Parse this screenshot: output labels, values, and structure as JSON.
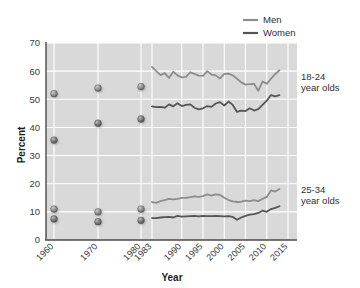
{
  "chart_data": {
    "type": "line",
    "title": "",
    "xlabel": "Year",
    "ylabel": "Percent",
    "ylim": [
      0,
      70
    ],
    "ytick_values": [
      0,
      10,
      20,
      30,
      40,
      50,
      60,
      70
    ],
    "ytick_labels": [
      "0",
      "10",
      "20",
      "30",
      "40",
      "50",
      "60",
      "70"
    ],
    "xtick_values": [
      1960,
      1970,
      1980,
      1983,
      1990,
      1995,
      2000,
      2005,
      2010,
      2015
    ],
    "xtick_labels": [
      "1960",
      "1970",
      "1980",
      "1983",
      "1990",
      "1995",
      "2000",
      "2005",
      "2010",
      "2015"
    ],
    "xlim": [
      1957,
      2016
    ],
    "grid": true,
    "grid_color": "#ffffff",
    "plot_background": "#d9d9d9",
    "legend": {
      "position": "top-right",
      "entries": [
        {
          "name": "Men",
          "color": "#8d8d8d"
        },
        {
          "name": "Women",
          "color": "#555555"
        }
      ]
    },
    "annotations": [
      {
        "text_line1": "18-24",
        "text_line2": "year olds",
        "x": 2016,
        "y": 56
      },
      {
        "text_line1": "25-34",
        "text_line2": "year olds",
        "x": 2016,
        "y": 16
      }
    ],
    "scatter_series": [
      {
        "name": "Men 18-24",
        "group": "18-24",
        "sex": "Men",
        "color": "#8d8d8d",
        "marker": "sphere",
        "points": [
          {
            "x": 1960,
            "y": 52.0
          },
          {
            "x": 1970,
            "y": 54.0
          },
          {
            "x": 1980,
            "y": 54.5
          }
        ]
      },
      {
        "name": "Women 18-24",
        "group": "18-24",
        "sex": "Women",
        "color": "#6b6b6b",
        "marker": "sphere",
        "points": [
          {
            "x": 1960,
            "y": 35.5
          },
          {
            "x": 1970,
            "y": 41.5
          },
          {
            "x": 1980,
            "y": 43.0
          }
        ]
      },
      {
        "name": "Men 25-34",
        "group": "25-34",
        "sex": "Men",
        "color": "#8d8d8d",
        "marker": "sphere",
        "points": [
          {
            "x": 1960,
            "y": 11.0
          },
          {
            "x": 1970,
            "y": 10.0
          },
          {
            "x": 1980,
            "y": 11.0
          }
        ]
      },
      {
        "name": "Women 25-34",
        "group": "25-34",
        "sex": "Women",
        "color": "#6b6b6b",
        "marker": "sphere",
        "points": [
          {
            "x": 1960,
            "y": 7.5
          },
          {
            "x": 1970,
            "y": 6.5
          },
          {
            "x": 1980,
            "y": 7.0
          }
        ]
      }
    ],
    "line_series": [
      {
        "name": "Men 18-24",
        "group": "18-24",
        "sex": "Men",
        "color": "#8d8d8d",
        "x": [
          1983,
          1984,
          1985,
          1986,
          1987,
          1988,
          1989,
          1990,
          1991,
          1992,
          1993,
          1994,
          1995,
          1996,
          1997,
          1998,
          1999,
          2000,
          2001,
          2002,
          2003,
          2004,
          2005,
          2006,
          2007,
          2008,
          2009,
          2010,
          2011,
          2012,
          2013
        ],
        "y": [
          61.5,
          60.0,
          58.6,
          59.3,
          57.6,
          59.8,
          58.5,
          57.8,
          58.0,
          59.6,
          59.0,
          58.4,
          58.3,
          60.0,
          58.8,
          58.5,
          57.4,
          59.0,
          59.1,
          58.5,
          57.3,
          56.0,
          55.2,
          55.4,
          55.5,
          53.0,
          56.3,
          55.5,
          57.3,
          59.0,
          60.3
        ]
      },
      {
        "name": "Women 18-24",
        "group": "18-24",
        "sex": "Women",
        "color": "#555555",
        "x": [
          1983,
          1984,
          1985,
          1986,
          1987,
          1988,
          1989,
          1990,
          1991,
          1992,
          1993,
          1994,
          1995,
          1996,
          1997,
          1998,
          1999,
          2000,
          2001,
          2002,
          2003,
          2004,
          2005,
          2006,
          2007,
          2008,
          2009,
          2010,
          2011,
          2012,
          2013
        ],
        "y": [
          47.5,
          47.2,
          47.3,
          47.0,
          48.2,
          47.5,
          48.6,
          47.6,
          48.0,
          48.2,
          47.0,
          46.4,
          46.8,
          47.6,
          47.3,
          48.5,
          49.0,
          47.8,
          49.2,
          48.0,
          45.5,
          46.0,
          45.8,
          46.8,
          46.0,
          46.5,
          48.0,
          49.5,
          51.5,
          51.0,
          51.5
        ]
      },
      {
        "name": "Men 25-34",
        "group": "25-34",
        "sex": "Men",
        "color": "#8d8d8d",
        "x": [
          1983,
          1984,
          1985,
          1986,
          1987,
          1988,
          1989,
          1990,
          1991,
          1992,
          1993,
          1994,
          1995,
          1996,
          1997,
          1998,
          1999,
          2000,
          2001,
          2002,
          2003,
          2004,
          2005,
          2006,
          2007,
          2008,
          2009,
          2010,
          2011,
          2012,
          2013
        ],
        "y": [
          13.5,
          13.2,
          13.8,
          14.2,
          14.6,
          14.4,
          14.6,
          15.0,
          15.0,
          15.2,
          15.5,
          15.3,
          15.6,
          16.2,
          15.8,
          16.2,
          16.0,
          15.0,
          14.2,
          13.7,
          13.5,
          13.6,
          14.0,
          13.8,
          14.2,
          13.8,
          14.6,
          15.3,
          17.6,
          17.2,
          18.1
        ]
      },
      {
        "name": "Women 25-34",
        "group": "25-34",
        "sex": "Women",
        "color": "#555555",
        "x": [
          1983,
          1984,
          1985,
          1986,
          1987,
          1988,
          1989,
          1990,
          1991,
          1992,
          1993,
          1994,
          1995,
          1996,
          1997,
          1998,
          1999,
          2000,
          2001,
          2002,
          2003,
          2004,
          2005,
          2006,
          2007,
          2008,
          2009,
          2010,
          2011,
          2012,
          2013
        ],
        "y": [
          7.8,
          7.8,
          8.0,
          8.1,
          8.2,
          8.0,
          8.6,
          8.3,
          8.4,
          8.5,
          8.6,
          8.4,
          8.6,
          8.5,
          8.5,
          8.6,
          8.5,
          8.4,
          8.5,
          8.2,
          7.2,
          8.0,
          8.6,
          9.0,
          9.2,
          9.6,
          10.4,
          10.0,
          11.0,
          11.4,
          12.0
        ]
      }
    ]
  }
}
